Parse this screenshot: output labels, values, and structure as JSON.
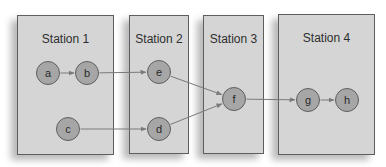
{
  "stations": [
    {
      "title": "Station 1",
      "x": 17,
      "y": 15,
      "w": 97,
      "h": 140
    },
    {
      "title": "Station 2",
      "x": 129,
      "y": 15,
      "w": 60,
      "h": 139
    },
    {
      "title": "Station 3",
      "x": 203,
      "y": 15,
      "w": 61,
      "h": 139
    },
    {
      "title": "Station 4",
      "x": 278,
      "y": 14,
      "w": 97,
      "h": 141
    }
  ],
  "nodes": [
    {
      "id": "a",
      "label": "a",
      "cx": 48,
      "cy": 73,
      "station": "Station 1"
    },
    {
      "id": "b",
      "label": "b",
      "cx": 87,
      "cy": 73,
      "station": "Station 1"
    },
    {
      "id": "c",
      "label": "c",
      "cx": 68,
      "cy": 129,
      "station": "Station 1"
    },
    {
      "id": "e",
      "label": "e",
      "cx": 159,
      "cy": 72,
      "station": "Station 2"
    },
    {
      "id": "d",
      "label": "d",
      "cx": 159,
      "cy": 129,
      "station": "Station 2"
    },
    {
      "id": "f",
      "label": "f",
      "cx": 234,
      "cy": 99,
      "station": "Station 3"
    },
    {
      "id": "g",
      "label": "g",
      "cx": 308,
      "cy": 100,
      "station": "Station 4"
    },
    {
      "id": "h",
      "label": "h",
      "cx": 347,
      "cy": 100,
      "station": "Station 4"
    }
  ],
  "edges": [
    {
      "from": "a",
      "to": "b"
    },
    {
      "from": "b",
      "to": "e"
    },
    {
      "from": "c",
      "to": "d"
    },
    {
      "from": "e",
      "to": "f"
    },
    {
      "from": "d",
      "to": "f"
    },
    {
      "from": "f",
      "to": "g"
    },
    {
      "from": "g",
      "to": "h"
    }
  ],
  "colors": {
    "station_fill": "#d5d5d5",
    "station_border": "#5e5e5e",
    "node_fill": "#a6a6a6",
    "node_border": "#5f5f5f",
    "edge": "#7a7a7a",
    "text": "#2e2e2e"
  }
}
